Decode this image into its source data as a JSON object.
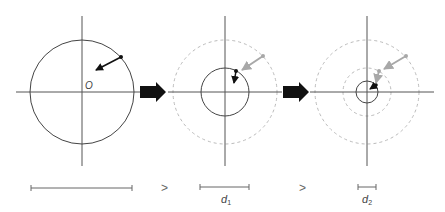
{
  "diagram": {
    "origin_label": "O",
    "colors": {
      "axis": "#555555",
      "circle": "#444444",
      "dashed_circle": "#bbbbbb",
      "black_arrow": "#111111",
      "gray_arrow": "#a8a8a8",
      "block_arrow": "#111111"
    },
    "panels": [
      {
        "name": "stage-1",
        "solid_radius": 52,
        "dashed_radii": []
      },
      {
        "name": "stage-2",
        "solid_radius": 24,
        "dashed_radii": [
          52
        ]
      },
      {
        "name": "stage-3",
        "solid_radius": 11,
        "dashed_radii": [
          24,
          52
        ]
      }
    ],
    "scale_bars": [
      {
        "label": "",
        "length": 101
      },
      {
        "label": "d1",
        "symbol": "d",
        "subscript": "1",
        "length": 49
      },
      {
        "label": "d2",
        "symbol": "d",
        "subscript": "2",
        "length": 18
      }
    ],
    "comparators": [
      ">",
      ">"
    ]
  }
}
